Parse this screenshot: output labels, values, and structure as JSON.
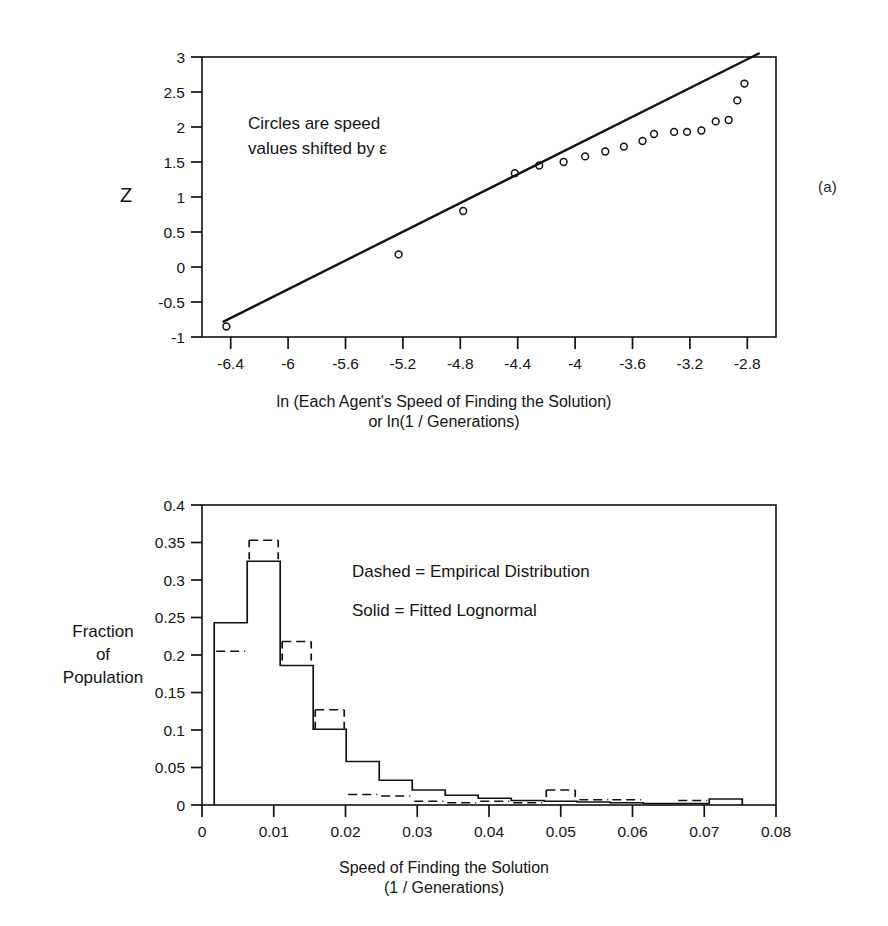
{
  "figure": {
    "panel_a_tag": "(a)",
    "panel_b_tag": "(b)"
  },
  "panel_a": {
    "annotation_line1": "Circles are speed",
    "annotation_line2": "values shifted by ε",
    "ylabel": "Z",
    "xlabel_line1": "ln (Each Agent's Speed of Finding the Solution)",
    "xlabel_line2": "or ln(1 / Generations)"
  },
  "panel_b": {
    "legend_line1": "Dashed = Empirical Distribution",
    "legend_line2": "Solid = Fitted Lognormal",
    "ylabel_line1": "Fraction",
    "ylabel_line2": "of",
    "ylabel_line3": "Population",
    "xlabel_line1": "Speed of Finding the Solution",
    "xlabel_line2": "(1 / Generations)"
  },
  "chart_data": [
    {
      "type": "scatter",
      "id": "normal-probability-plot",
      "title": "",
      "xlabel": "ln (Each Agent's Speed of Finding the Solution) or ln(1 / Generations)",
      "ylabel": "Z",
      "xlim": [
        -6.6,
        -2.6
      ],
      "ylim": [
        -1,
        3
      ],
      "xticks": [
        -6.4,
        -6,
        -5.6,
        -5.2,
        -4.8,
        -4.4,
        -4,
        -3.6,
        -3.2,
        -2.8
      ],
      "xticklabels": [
        "-6.4",
        "-6",
        "-5.6",
        "-5.2",
        "-4.8",
        "-4.4",
        "-4",
        "-3.6",
        "-3.2",
        "-2.8"
      ],
      "yticks": [
        -1,
        -0.5,
        0,
        0.5,
        1,
        1.5,
        2,
        2.5,
        3
      ],
      "yticklabels": [
        "-1",
        "-0.5",
        "0",
        "0.5",
        "1",
        "1.5",
        "2",
        "2.5",
        "3"
      ],
      "grid": false,
      "legend": "none",
      "annotations": [
        "Circles are speed values shifted by ε"
      ],
      "series": [
        {
          "name": "Circles (speed values shifted by epsilon)",
          "marker": "open-circle",
          "x": [
            -6.43,
            -5.23,
            -4.78,
            -4.42,
            -4.25,
            -4.08,
            -3.93,
            -3.79,
            -3.66,
            -3.53,
            -3.45,
            -3.31,
            -3.22,
            -3.12,
            -3.02,
            -2.93,
            -2.87,
            -2.82
          ],
          "y": [
            -0.85,
            0.18,
            0.8,
            1.34,
            1.45,
            1.5,
            1.58,
            1.65,
            1.72,
            1.8,
            1.9,
            1.93,
            1.93,
            1.95,
            2.08,
            2.1,
            2.38,
            2.62
          ]
        },
        {
          "name": "Fitted line",
          "marker": "line",
          "x": [
            -6.45,
            -2.72
          ],
          "y": [
            -0.78,
            3.05
          ]
        }
      ]
    },
    {
      "type": "bar",
      "id": "speed-histogram",
      "title": "",
      "xlabel": "Speed of Finding the Solution (1 / Generations)",
      "ylabel": "Fraction of Population",
      "xlim": [
        0,
        0.08
      ],
      "ylim": [
        0,
        0.4
      ],
      "xticks": [
        0,
        0.01,
        0.02,
        0.03,
        0.04,
        0.05,
        0.06,
        0.07,
        0.08
      ],
      "xticklabels": [
        "0",
        "0.01",
        "0.02",
        "0.03",
        "0.04",
        "0.05",
        "0.06",
        "0.07",
        "0.08"
      ],
      "yticks": [
        0,
        0.05,
        0.1,
        0.15,
        0.2,
        0.25,
        0.3,
        0.35,
        0.4
      ],
      "yticklabels": [
        "0",
        "0.05",
        "0.1",
        "0.15",
        "0.2",
        "0.25",
        "0.3",
        "0.35",
        "0.4"
      ],
      "grid": false,
      "legend": "Dashed = Empirical Distribution; Solid = Fitted Lognormal",
      "bin_edges": [
        0.0017,
        0.0063,
        0.0109,
        0.0155,
        0.0201,
        0.0247,
        0.0293,
        0.0339,
        0.0385,
        0.0431,
        0.0477,
        0.0523,
        0.0569,
        0.0615,
        0.0661,
        0.0707,
        0.0753
      ],
      "series": [
        {
          "name": "Solid = Fitted Lognormal",
          "style": "solid",
          "values": [
            0.243,
            0.325,
            0.186,
            0.101,
            0.058,
            0.033,
            0.02,
            0.013,
            0.009,
            0.006,
            0.005,
            0.004,
            0.003,
            0.002,
            0.002,
            0.008
          ]
        },
        {
          "name": "Dashed = Empirical Distribution",
          "style": "dashed",
          "values": [
            0.205,
            0.353,
            0.218,
            0.127,
            0.014,
            0.012,
            0.005,
            0.003,
            0.005,
            0.003,
            0.02,
            0.007,
            0.007,
            0.0,
            0.006,
            0.0
          ]
        }
      ]
    }
  ]
}
